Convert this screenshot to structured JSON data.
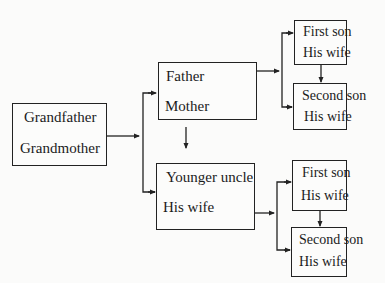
{
  "diagram": {
    "type": "family-tree",
    "nodes": {
      "grandparents": {
        "top": "Grandfather",
        "bottom": "Grandmother"
      },
      "parents": {
        "top": "Father",
        "bottom": "Mother"
      },
      "uncle": {
        "top": "Younger uncle",
        "bottom": "His wife"
      },
      "parents_son1": {
        "top": "First son",
        "bottom": "His wife"
      },
      "parents_son2": {
        "top": "Second son",
        "bottom": "His wife"
      },
      "uncle_son1": {
        "top": "First son",
        "bottom": "His wife"
      },
      "uncle_son2": {
        "top": "Second son",
        "bottom": "His wife"
      }
    },
    "edges": [
      [
        "grandparents",
        "parents"
      ],
      [
        "grandparents",
        "uncle"
      ],
      [
        "parents",
        "uncle"
      ],
      [
        "parents",
        "parents_son1"
      ],
      [
        "parents",
        "parents_son2"
      ],
      [
        "parents_son1",
        "parents_son2"
      ],
      [
        "uncle",
        "uncle_son1"
      ],
      [
        "uncle",
        "uncle_son2"
      ],
      [
        "uncle_son1",
        "uncle_son2"
      ]
    ],
    "colors": {
      "line": "#222222",
      "background": "#fbfbfa"
    }
  }
}
